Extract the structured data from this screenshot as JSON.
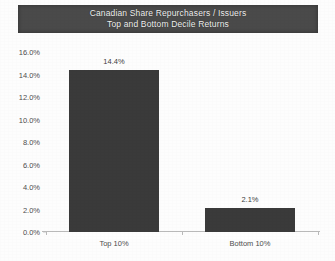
{
  "chart_data": {
    "type": "bar",
    "title": "Canadian Share Repurchasers / Issuers",
    "subtitle": "Top and Bottom Decile Returns",
    "categories": [
      "Top 10%",
      "Bottom 10%"
    ],
    "values": [
      14.4,
      2.1
    ],
    "value_labels": [
      "14.4%",
      "2.1%"
    ],
    "xlabel": "",
    "ylabel": "",
    "ylim": [
      0,
      16
    ],
    "ytick_step": 2,
    "ytick_labels": [
      "16.0%",
      "14.0%",
      "12.0%",
      "10.0%",
      "8.0%",
      "6.0%",
      "4.0%",
      "2.0%",
      "0.0%"
    ],
    "ytick_values": [
      16,
      14,
      12,
      10,
      8,
      6,
      4,
      2,
      0
    ],
    "grid": false,
    "legend": false,
    "bar_color": "#3a3a3a",
    "title_band_color": "#4a4a4a",
    "title_text_color": "#f2f2f2",
    "axis_color": "#b9b9b9",
    "background_color": "#fdfdfd"
  }
}
